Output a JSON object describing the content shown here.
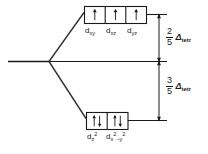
{
  "diagram": {
    "type": "energy-level-splitting",
    "stroke_color": "#1a1a1a",
    "background_color": "#ffffff",
    "upper_set": {
      "name": "t2",
      "orbitals": [
        {
          "label_d": "d",
          "sub": "xy",
          "sup": "",
          "electrons": "up"
        },
        {
          "label_d": "d",
          "sub": "xz",
          "sup": "",
          "electrons": "up"
        },
        {
          "label_d": "d",
          "sub": "yz",
          "sup": "",
          "electrons": "up"
        }
      ]
    },
    "lower_set": {
      "name": "e",
      "orbitals": [
        {
          "label_d": "d",
          "sub": "z",
          "sup": "2",
          "electrons": "up-down"
        },
        {
          "label_d": "d",
          "sub": "x",
          "sup": "2",
          "sub2": "–y",
          "sup2": "2",
          "electrons": "up-down"
        }
      ]
    },
    "annotations": {
      "upper_split": {
        "numerator": "2",
        "denominator": "5",
        "symbol": "Δ",
        "subscript": "tetr"
      },
      "lower_split": {
        "numerator": "3",
        "denominator": "5",
        "symbol": "Δ",
        "subscript": "tetr"
      }
    }
  }
}
